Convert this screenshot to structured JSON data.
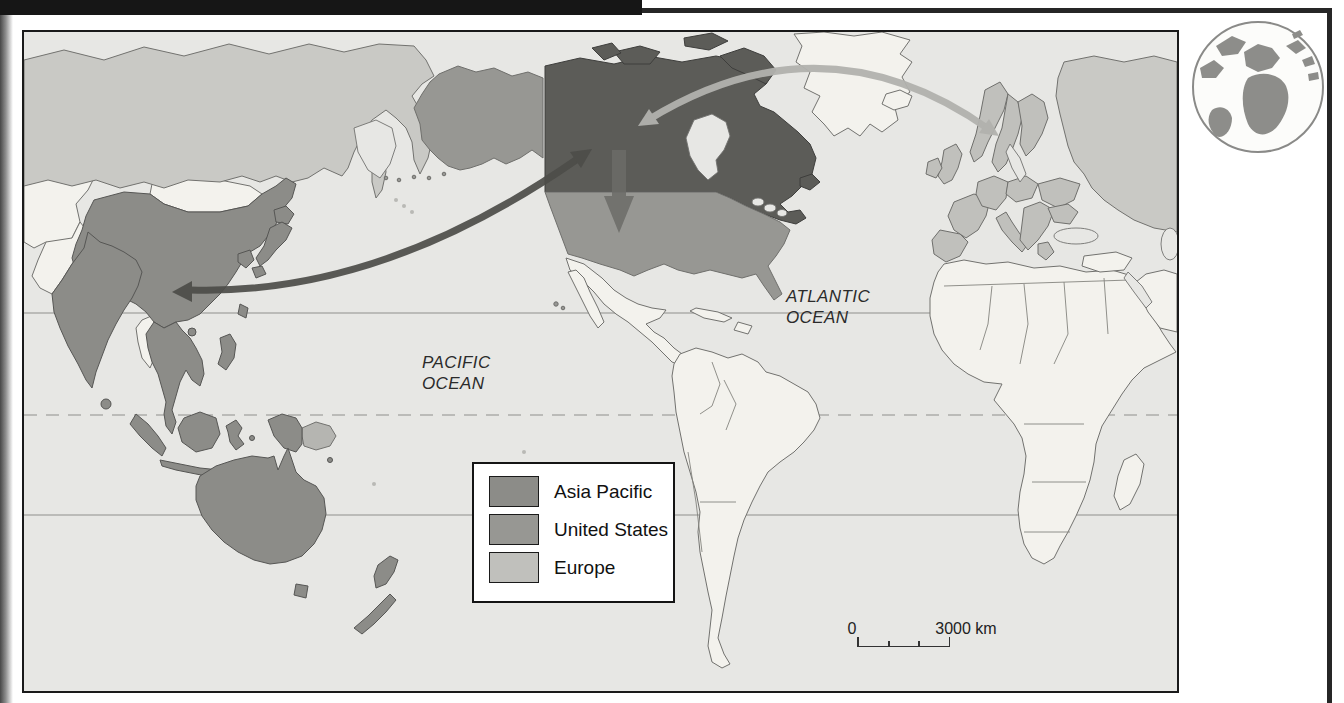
{
  "map": {
    "ocean_labels": {
      "pacific": [
        "PACIFIC",
        "OCEAN"
      ],
      "atlantic": [
        "ATLANTIC",
        "OCEAN"
      ]
    },
    "legend": {
      "items": [
        {
          "label": "Asia Pacific",
          "color": "#8c8c88"
        },
        {
          "label": "United States",
          "color": "#979793"
        },
        {
          "label": "Europe",
          "color": "#c0c0bc"
        }
      ]
    },
    "scale_bar": {
      "zero_label": "0",
      "max_label": "3000 km"
    },
    "region_colors": {
      "canada": "#5c5c58",
      "asia_pacific": "#8c8c88",
      "united_states": "#979793",
      "europe": "#c0c0bc",
      "russia": "#c9c9c5",
      "other_land": "#f3f2ed",
      "ocean": "#e7e7e4"
    },
    "arrows": [
      {
        "name": "canada-asia-pacific",
        "color": "#4d4d49"
      },
      {
        "name": "canada-europe",
        "color": "#b2b2ae"
      },
      {
        "name": "canada-united-states",
        "color": "#6b6b67"
      }
    ]
  },
  "icons": {
    "globe": "globe-icon"
  }
}
